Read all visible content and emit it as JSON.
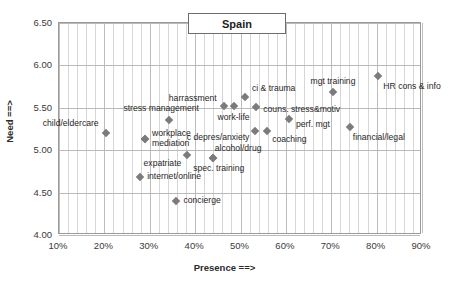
{
  "chart_data": {
    "type": "scatter",
    "title": "Spain",
    "xlabel": "Presence ==>",
    "ylabel": "Need ==>",
    "xlim": [
      0.1,
      0.9
    ],
    "ylim": [
      4.0,
      6.5
    ],
    "xticks": [
      "10%",
      "20%",
      "30%",
      "40%",
      "50%",
      "60%",
      "70%",
      "80%",
      "90%"
    ],
    "yticks": [
      "4.00",
      "4.50",
      "5.00",
      "5.50",
      "6.00",
      "6.50"
    ],
    "grid": true,
    "legend": "none",
    "marker": "diamond",
    "marker_color": "#7b7b7b",
    "points": [
      {
        "label": "child/eldercare",
        "x": 0.205,
        "y": 5.19,
        "pos": "r",
        "dx": -7,
        "dy": -9
      },
      {
        "label": "internet/online",
        "x": 0.281,
        "y": 4.67,
        "pos": "l",
        "dx": 7,
        "dy": 0
      },
      {
        "label": "workplace",
        "x": 0.292,
        "y": 5.12,
        "pos": "l",
        "dx": 7,
        "dy": -5
      },
      {
        "label": "mediation",
        "x": 0.292,
        "y": 5.12,
        "pos": "l",
        "dx": 7,
        "dy": 5
      },
      {
        "label": "stress management",
        "x": 0.345,
        "y": 5.34,
        "pos": "c",
        "dx": -8,
        "dy": -11
      },
      {
        "label": "concierge",
        "x": 0.359,
        "y": 4.39,
        "pos": "l",
        "dx": 8,
        "dy": 0
      },
      {
        "label": "expatriate",
        "x": 0.385,
        "y": 4.93,
        "pos": "r",
        "dx": -6,
        "dy": 9
      },
      {
        "label": "alcohol/drug",
        "x": 0.441,
        "y": 4.9,
        "pos": "l",
        "dx": 2,
        "dy": -9
      },
      {
        "label": "spec. training",
        "x": 0.441,
        "y": 4.9,
        "pos": "c",
        "dx": 6,
        "dy": 11
      },
      {
        "label": "harrassment",
        "x": 0.465,
        "y": 5.51,
        "pos": "r",
        "dx": -7,
        "dy": -7
      },
      {
        "label": "work-life",
        "x": 0.487,
        "y": 5.51,
        "pos": "c",
        "dx": 0,
        "dy": 12
      },
      {
        "label": "ci & trauma",
        "x": 0.512,
        "y": 5.62,
        "pos": "l",
        "dx": 7,
        "dy": -8
      },
      {
        "label": "c depres/anxiety",
        "x": 0.535,
        "y": 5.22,
        "pos": "r",
        "dx": -6,
        "dy": 7
      },
      {
        "label": "couns. stress&motiv",
        "x": 0.537,
        "y": 5.5,
        "pos": "l",
        "dx": 7,
        "dy": 3
      },
      {
        "label": "coaching",
        "x": 0.561,
        "y": 5.21,
        "pos": "l",
        "dx": 5,
        "dy": 9
      },
      {
        "label": "perf. mgt",
        "x": 0.609,
        "y": 5.36,
        "pos": "l",
        "dx": 7,
        "dy": 6
      },
      {
        "label": "mgt training",
        "x": 0.706,
        "y": 5.68,
        "pos": "c",
        "dx": 0,
        "dy": -10
      },
      {
        "label": "financial/legal",
        "x": 0.743,
        "y": 5.26,
        "pos": "l",
        "dx": 3,
        "dy": 11
      },
      {
        "label": "HR cons & info",
        "x": 0.806,
        "y": 5.86,
        "pos": "l",
        "dx": 5,
        "dy": 11
      }
    ]
  }
}
